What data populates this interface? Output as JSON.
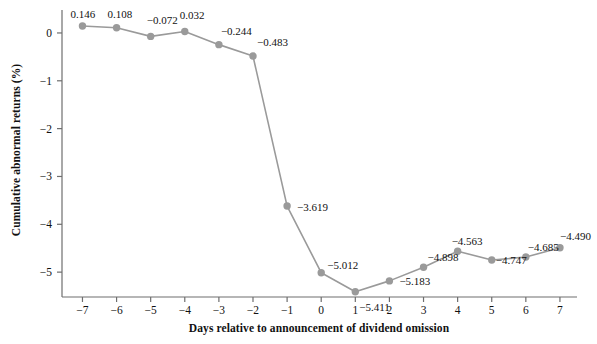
{
  "chart_data": {
    "type": "line",
    "title": "",
    "xlabel": "Days relative to announcement of dividend omission",
    "ylabel": "Cumulative abnormal returns (%)",
    "x": [
      -7,
      -6,
      -5,
      -4,
      -3,
      -2,
      -1,
      0,
      1,
      2,
      3,
      4,
      5,
      6,
      7
    ],
    "xtick_labels": [
      "−7",
      "−6",
      "−5",
      "−4",
      "−3",
      "−2",
      "−1",
      "0",
      "1",
      "2",
      "3",
      "4",
      "5",
      "6",
      "7"
    ],
    "values": [
      0.146,
      0.108,
      -0.072,
      0.032,
      -0.244,
      -0.483,
      -3.619,
      -5.012,
      -5.411,
      -5.183,
      -4.898,
      -4.563,
      -4.747,
      -4.685,
      -4.49
    ],
    "point_labels": [
      "0.146",
      "0.108",
      "−0.072",
      "0.032",
      "−0.244",
      "−0.483",
      "−3.619",
      "−5.012",
      "−5.411",
      "−5.183",
      "−4.898",
      "−4.563",
      "−4.747",
      "−4.685",
      "−4.490"
    ],
    "yticks": [
      0,
      -1,
      -2,
      -3,
      -4,
      -5
    ],
    "ytick_labels": [
      "0",
      "−1",
      "−2",
      "−3",
      "−4",
      "−5"
    ],
    "ylim": [
      -5.52,
      0.48
    ],
    "xlim": [
      -7.6,
      7.5
    ],
    "grid": false,
    "legend": "none",
    "series_color": "#9a9a9a",
    "axis_color": "#6e6e6e",
    "text_color": "#111111",
    "background": "#ffffff",
    "marker": "circle",
    "marker_size": 5
  }
}
